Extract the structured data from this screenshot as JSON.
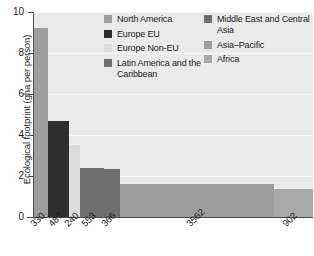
{
  "chart_data": {
    "type": "bar",
    "title": "",
    "subtitle": "",
    "xlabel": "",
    "ylabel": "Ecological footprint (gha per person)",
    "ylim": [
      0,
      10
    ],
    "yticks": [
      0,
      2,
      4,
      6,
      8,
      10
    ],
    "yticklabels": [
      "0",
      "2",
      "4",
      "6",
      "8",
      "10"
    ],
    "grid": true,
    "grid_axis": "y",
    "legend_position": "upper-center",
    "variable_width": true,
    "width_unit": "population (millions)",
    "categories": [
      "North America",
      "Europe EU",
      "Europe Non-EU",
      "Latin America and the Caribbean",
      "Middle East and Central Asia",
      "Asia-Pacific",
      "Africa"
    ],
    "xticklabels": [
      "330",
      "487",
      "240",
      "553",
      "366",
      "3562",
      "902"
    ],
    "widths": [
      330,
      487,
      240,
      553,
      366,
      3562,
      902
    ],
    "values": [
      9.2,
      4.7,
      3.5,
      2.4,
      2.35,
      1.6,
      1.35
    ],
    "colors": [
      "#9d9d9d",
      "#2e2e2e",
      "#dcdcdc",
      "#6e6e6e",
      "#6e6e6e",
      "#9d9d9d",
      "#a8a8a8"
    ],
    "plot_background": "#eaeaea",
    "axis_color": "#4d4d4d",
    "gridline_color": "#f7f7f7"
  },
  "legend": {
    "left_column": [
      {
        "label": "North America",
        "color": "#9d9d9d"
      },
      {
        "label": "Europe EU",
        "color": "#2e2e2e"
      },
      {
        "label": "Europe Non-EU",
        "color": "#dcdcdc"
      },
      {
        "label": "Latin America and the Caribbean",
        "color": "#6e6e6e"
      }
    ],
    "right_column": [
      {
        "label": "Middle East and Central Asia",
        "color": "#6e6e6e"
      },
      {
        "label": "Asia–Pacific",
        "color": "#9d9d9d"
      },
      {
        "label": "Africa",
        "color": "#a8a8a8"
      }
    ]
  }
}
